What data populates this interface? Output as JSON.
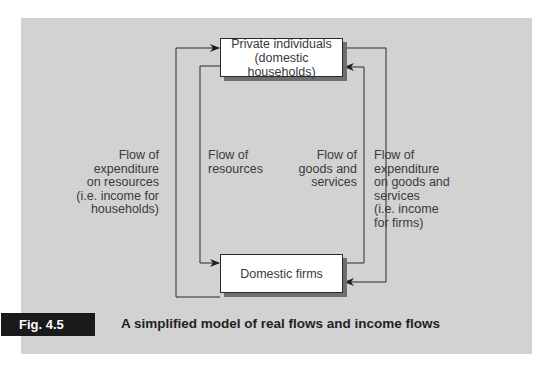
{
  "figure": {
    "tag": "Fig. 4.5",
    "caption": "A simplified model of real flows and income flows"
  },
  "nodes": {
    "households": {
      "line1": "Private individuals",
      "line2": "(domestic households)"
    },
    "firms": {
      "label": "Domestic firms"
    }
  },
  "flows": {
    "expenditure_on_resources": "Flow of\nexpenditure\non resources\n(i.e. income for\nhouseholds)",
    "resources": "Flow of\nresources",
    "goods_and_services": "Flow of\ngoods and\nservices",
    "expenditure_on_goods": "Flow of\nexpenditure\non goods and\nservices\n(i.e. income\nfor firms)"
  },
  "colors": {
    "panel": "#d2d2d2",
    "box": "#ffffff",
    "line": "#2a2a2a",
    "tag_bg": "#1a1a1a"
  }
}
